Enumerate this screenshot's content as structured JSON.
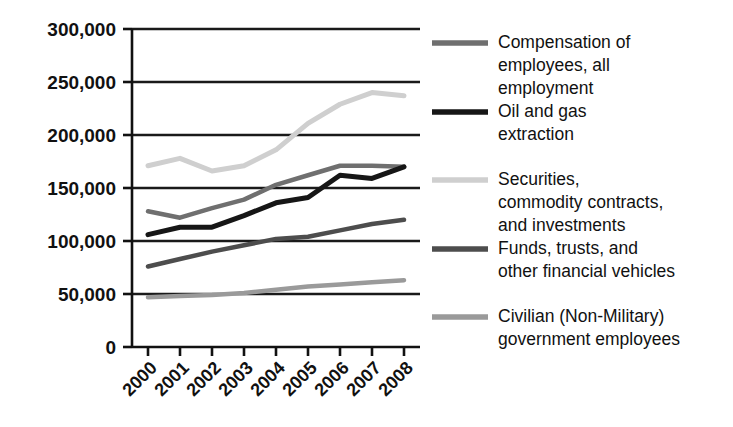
{
  "chart_data": {
    "type": "line",
    "title": "",
    "subtitle": "",
    "xlabel": "",
    "ylabel": "",
    "categories": [
      "2000",
      "2001",
      "2002",
      "2003",
      "2004",
      "2005",
      "2006",
      "2007",
      "2008"
    ],
    "x": [
      2000,
      2001,
      2002,
      2003,
      2004,
      2005,
      2006,
      2007,
      2008
    ],
    "ylim": [
      0,
      300000
    ],
    "ytick_values": [
      0,
      50000,
      100000,
      150000,
      200000,
      250000,
      300000
    ],
    "ytick_labels": [
      "0",
      "50,000",
      "100,000",
      "150,000",
      "200,000",
      "250,000",
      "300,000"
    ],
    "grid": "horizontal",
    "legend_position": "right",
    "series": [
      {
        "name": "Compensation of employees, all employment",
        "color": "#6f6f6f",
        "width": 4.5,
        "values": [
          128000,
          122000,
          131000,
          139000,
          153000,
          162000,
          171000,
          171000,
          170000
        ]
      },
      {
        "name": "Oil and gas extraction",
        "color": "#161616",
        "width": 5.0,
        "values": [
          106000,
          113000,
          113000,
          124000,
          136000,
          141000,
          162000,
          159000,
          170000
        ]
      },
      {
        "name": "Securities, commodity contracts, and investments",
        "color": "#cfcfcf",
        "width": 5.0,
        "values": [
          171000,
          178000,
          166000,
          171000,
          186000,
          211000,
          229000,
          240000,
          237000
        ]
      },
      {
        "name": "Funds, trusts, and other financial vehicles",
        "color": "#4d4d4d",
        "width": 4.5,
        "values": [
          76000,
          83000,
          90000,
          96000,
          102000,
          104000,
          110000,
          116000,
          120000
        ]
      },
      {
        "name": "Civilian (Non-Military) government employees",
        "color": "#9a9a9a",
        "width": 4.5,
        "values": [
          47000,
          48000,
          49000,
          51000,
          54000,
          57000,
          59000,
          61000,
          63000
        ]
      }
    ]
  },
  "axes": {
    "y_labels": [
      "300,000",
      "250,000",
      "200,000",
      "150,000",
      "100,000",
      "50,000",
      "0"
    ],
    "x_labels": [
      "2000",
      "2001",
      "2002",
      "2003",
      "2004",
      "2005",
      "2006",
      "2007",
      "2008"
    ]
  },
  "legend": {
    "entries": [
      {
        "label_lines": [
          "Compensation of",
          "employees, all",
          "employment"
        ],
        "swatch_color": "#6f6f6f",
        "swatch_name": "legend-swatch-compensation"
      },
      {
        "label_lines": [
          "Oil and gas",
          "extraction"
        ],
        "swatch_color": "#161616",
        "swatch_name": "legend-swatch-oil-and-gas"
      },
      {
        "label_lines": [
          "Securities,",
          "commodity contracts,",
          "and investments"
        ],
        "swatch_color": "#cfcfcf",
        "swatch_name": "legend-swatch-securities"
      },
      {
        "label_lines": [
          "Funds, trusts, and",
          "other financial vehicles"
        ],
        "swatch_color": "#4d4d4d",
        "swatch_name": "legend-swatch-funds"
      },
      {
        "label_lines": [
          "Civilian (Non-Military)",
          "government employees"
        ],
        "swatch_color": "#9a9a9a",
        "swatch_name": "legend-swatch-civilian"
      }
    ]
  },
  "style": {
    "axis_color": "#111111",
    "grid_color": "#1a1a1a",
    "background": "#ffffff"
  }
}
